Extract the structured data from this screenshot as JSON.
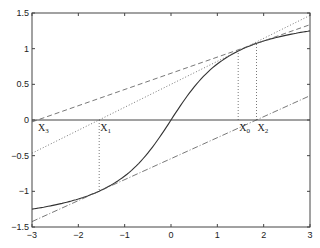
{
  "chart_data": {
    "type": "line",
    "title": "",
    "xlabel": "",
    "ylabel": "",
    "xlim": [
      -3,
      3
    ],
    "ylim": [
      -1.5,
      1.5
    ],
    "grid": false,
    "legend": null,
    "x_ticks": [
      -3,
      -2,
      -1,
      0,
      1,
      2,
      3
    ],
    "y_ticks": [
      -1.5,
      -1,
      -0.5,
      0,
      0.5,
      1,
      1.5
    ],
    "x_tick_labels": [
      "−3",
      "−2",
      "−1",
      "0",
      "1",
      "2",
      "3"
    ],
    "y_tick_labels": [
      "−1.5",
      "−1",
      "−0.5",
      "0",
      "0.5",
      "1",
      "1.5"
    ],
    "series": [
      {
        "name": "curve",
        "style": "solid",
        "function": "arctan(x)",
        "x": [
          -3,
          -2.5,
          -2,
          -1.5,
          -1,
          -0.5,
          0,
          0.5,
          1,
          1.5,
          2,
          2.5,
          3
        ],
        "y": [
          -1.249,
          -1.19,
          -1.107,
          -0.983,
          -0.785,
          -0.464,
          0,
          0.464,
          0.785,
          0.983,
          1.107,
          1.19,
          1.249
        ]
      },
      {
        "name": "tangent at X0",
        "style": "dotted",
        "x": [
          -3,
          3
        ],
        "y": [
          -0.466,
          1.466
        ]
      },
      {
        "name": "tangent at X1",
        "style": "dashdot",
        "x": [
          -3,
          3
        ],
        "y": [
          -1.424,
          0.34
        ]
      },
      {
        "name": "tangent at X2",
        "style": "dashed",
        "x": [
          -3,
          3
        ],
        "y": [
          -0.026,
          1.336
        ]
      },
      {
        "name": "drop X0",
        "style": "dotted",
        "x": [
          1.45,
          1.45
        ],
        "y": [
          0,
          0.967
        ]
      },
      {
        "name": "drop X1",
        "style": "dotted",
        "x": [
          -1.55,
          -1.55
        ],
        "y": [
          0,
          -0.998
        ]
      },
      {
        "name": "drop X2",
        "style": "dotted",
        "x": [
          1.845,
          1.845
        ],
        "y": [
          0,
          1.074
        ]
      }
    ],
    "annotations": [
      {
        "text": "X",
        "sub": "3",
        "x": -2.89,
        "y": 0
      },
      {
        "text": "X",
        "sub": "1",
        "x": -1.55,
        "y": 0
      },
      {
        "text": "X",
        "sub": "0",
        "x": 1.45,
        "y": 0
      },
      {
        "text": "X",
        "sub": "2",
        "x": 1.845,
        "y": 0
      }
    ],
    "zero_line": true
  }
}
